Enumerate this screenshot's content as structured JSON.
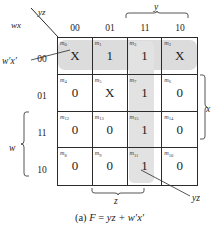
{
  "figure": {
    "caption_prefix": "(a)",
    "caption_function": "F",
    "caption_equals": "=",
    "caption_expression": "yz + w′x′",
    "caption_full": "(a) F = yz + w′x′"
  },
  "axes": {
    "corner_top_label": "yz",
    "corner_bottom_label": "wx",
    "column_header_vars": "yz",
    "row_header_vars": "wx",
    "column_ticks": [
      "00",
      "01",
      "11",
      "10"
    ],
    "row_ticks": [
      "00",
      "01",
      "11",
      "10"
    ]
  },
  "variable_braces": [
    {
      "name": "y",
      "label": "y",
      "position": "top",
      "spans_ticks": [
        "11",
        "10"
      ]
    },
    {
      "name": "x",
      "label": "x",
      "position": "right",
      "spans_ticks": [
        "01",
        "11"
      ]
    },
    {
      "name": "w",
      "label": "w",
      "position": "left",
      "spans_ticks": [
        "11",
        "10"
      ]
    },
    {
      "name": "z",
      "label": "z",
      "position": "bottom",
      "spans_ticks": [
        "01",
        "11"
      ]
    }
  ],
  "callouts": [
    {
      "name": "wx-prime",
      "label": "w′x′",
      "points_to": "row-00-group"
    },
    {
      "name": "yz",
      "label": "yz",
      "points_to": "m11-cell"
    }
  ],
  "groups": [
    {
      "name": "w'x'",
      "cells": [
        "m0",
        "m1",
        "m3",
        "m2"
      ],
      "shade": "#dcdcdc"
    },
    {
      "name": "yz",
      "cells": [
        "m3",
        "m7",
        "m15",
        "m11"
      ],
      "shade": "#e2e2e2"
    }
  ],
  "colors": {
    "grid_line": "#2b2b2b",
    "text": "#1b1b1b",
    "group_shade_row": "#dcdcdc",
    "group_shade_col": "#e2e2e2",
    "background": "#ffffff"
  },
  "kmap": {
    "rows": [
      {
        "row_label": "00",
        "cells": [
          {
            "minterm": "m",
            "index": "0",
            "value": "X"
          },
          {
            "minterm": "m",
            "index": "1",
            "value": "1"
          },
          {
            "minterm": "m",
            "index": "3",
            "value": "1"
          },
          {
            "minterm": "m",
            "index": "2",
            "value": "X"
          }
        ]
      },
      {
        "row_label": "01",
        "cells": [
          {
            "minterm": "m",
            "index": "4",
            "value": "0"
          },
          {
            "minterm": "m",
            "index": "5",
            "value": "X"
          },
          {
            "minterm": "m",
            "index": "7",
            "value": "1"
          },
          {
            "minterm": "m",
            "index": "6",
            "value": "0"
          }
        ]
      },
      {
        "row_label": "11",
        "cells": [
          {
            "minterm": "m",
            "index": "12",
            "value": "0"
          },
          {
            "minterm": "m",
            "index": "13",
            "value": "0"
          },
          {
            "minterm": "m",
            "index": "15",
            "value": "1"
          },
          {
            "minterm": "m",
            "index": "14",
            "value": "0"
          }
        ]
      },
      {
        "row_label": "10",
        "cells": [
          {
            "minterm": "m",
            "index": "8",
            "value": "0"
          },
          {
            "minterm": "m",
            "index": "9",
            "value": "0"
          },
          {
            "minterm": "m",
            "index": "11",
            "value": "1"
          },
          {
            "minterm": "m",
            "index": "10",
            "value": "0"
          }
        ]
      }
    ]
  }
}
